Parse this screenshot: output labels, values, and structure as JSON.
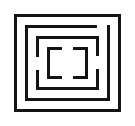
{
  "image": {
    "title": "Nested rectangular maze glyph",
    "width": 135,
    "height": 126,
    "background_color": "#ffffff",
    "stroke_color": "#141414",
    "description": "Monochrome line-art icon of four concentric rectangular rings with gaps, innermost pair forming facing brackets"
  },
  "glyph": {
    "ring_count": 4,
    "rings": [
      {
        "name": "outer-frame",
        "x": 14,
        "y": 14,
        "width": 107,
        "height": 98,
        "stroke_width": 3,
        "closed": true,
        "gaps": []
      },
      {
        "name": "ring-2",
        "x": 25,
        "y": 25,
        "width": 85,
        "height": 76,
        "stroke_width": 3,
        "closed": false,
        "gaps": [
          {
            "edge": "top",
            "start": 97,
            "end": 110
          },
          {
            "edge": "bottom",
            "start": 25,
            "end": 38
          }
        ]
      },
      {
        "name": "ring-3",
        "x": 36,
        "y": 36,
        "width": 63,
        "height": 54,
        "stroke_width": 3,
        "closed": false,
        "gaps": [
          {
            "edge": "left",
            "start": 57,
            "end": 70
          },
          {
            "edge": "right",
            "start": 56,
            "end": 69
          }
        ]
      },
      {
        "name": "inner-brackets",
        "x": 47,
        "y": 47,
        "width": 41,
        "height": 32,
        "stroke_width": 3,
        "closed": false,
        "gaps": [
          {
            "edge": "top",
            "start": 62,
            "end": 73
          },
          {
            "edge": "bottom",
            "start": 62,
            "end": 73
          }
        ]
      }
    ],
    "inner_bracket_left_label": "[",
    "inner_bracket_right_label": "]"
  }
}
